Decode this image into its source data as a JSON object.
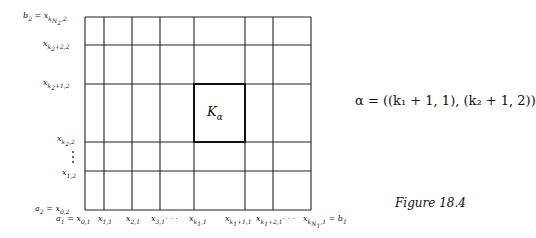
{
  "diagram": {
    "grid": {
      "x_lines": [
        85,
        104,
        132,
        160,
        194,
        245,
        273,
        311
      ],
      "y_lines": [
        17,
        45,
        84,
        142,
        171,
        210
      ],
      "highlight_cell": {
        "x0": 194,
        "x1": 245,
        "y0": 84,
        "y1": 142
      },
      "line_color": "#222222"
    },
    "cell_label": "Kα",
    "y_labels": [
      {
        "text": "b₂ = x_{k_{N₂},2}",
        "y": 17
      },
      {
        "text": "x_{k₂+2,2}",
        "y": 45
      },
      {
        "text": "x_{k₂+1,2}",
        "y": 84
      },
      {
        "text": "x_{k₂,2}",
        "y": 142
      },
      {
        "text": "x_{1,2}",
        "y": 171
      },
      {
        "text": "a₂ = x_{0,2}",
        "y": 210
      }
    ],
    "x_labels": [
      {
        "text": "a₁ = x_{0,1}"
      },
      {
        "text": "x_{1,1}"
      },
      {
        "text": "x_{2,1}"
      },
      {
        "text": "x_{3,1}· · ·"
      },
      {
        "text": "x_{k₁,1}"
      },
      {
        "text": "x_{k₁+1,1}"
      },
      {
        "text": "x_{k₁+2,1}· · ·"
      },
      {
        "text": "x_{k_{N₁},1} = b₁"
      }
    ],
    "alpha_equation": "α = ((k₁ + 1, 1), (k₂ + 1, 2))",
    "caption": "Figure 18.4"
  }
}
